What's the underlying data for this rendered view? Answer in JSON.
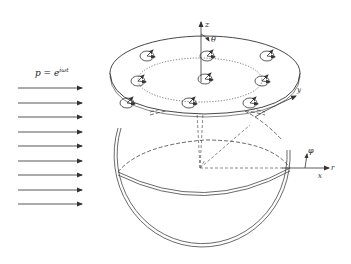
{
  "diagram": {
    "type": "physics-schematic",
    "colors": {
      "line": "#333333",
      "background": "#ffffff"
    },
    "incident_wave": {
      "label_base": "p = e",
      "label_exponent": "iωt",
      "arrow_count": 9,
      "arrow_y": [
        88,
        103,
        117,
        132,
        146,
        161,
        175,
        190,
        204
      ]
    },
    "axes": {
      "z_label": "z",
      "theta_label": "θ",
      "y_label": "y",
      "phi_label": "φ",
      "r_label": "r",
      "x_label": "x"
    },
    "disk": {
      "resonator_count": 9,
      "resonators": [
        {
          "x": 147,
          "y": 56
        },
        {
          "x": 207,
          "y": 56
        },
        {
          "x": 267,
          "y": 56
        },
        {
          "x": 138,
          "y": 81
        },
        {
          "x": 205,
          "y": 78
        },
        {
          "x": 262,
          "y": 81
        },
        {
          "x": 127,
          "y": 103
        },
        {
          "x": 189,
          "y": 103
        },
        {
          "x": 250,
          "y": 103
        }
      ]
    }
  }
}
